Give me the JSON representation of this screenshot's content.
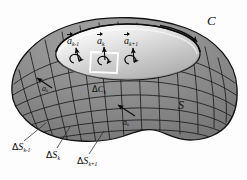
{
  "figure": {
    "kind": "surface-grid-diagram",
    "background_color": "#fdfdfd",
    "surface": {
      "fill_color": "#8b8b8b",
      "cap_fill_color": "#d8d8d8",
      "outline_color": "#141414",
      "grid_color": "#1a1a1a",
      "highlight_color": "#ffffff"
    },
    "labels": {
      "boundary_curve": "C",
      "surface": "S",
      "vector_prev": {
        "symbol": "a",
        "subscript": "k-1"
      },
      "vector_k": {
        "symbol": "a",
        "subscript": "k"
      },
      "vector_next": {
        "symbol": "a",
        "subscript": "k+1"
      },
      "circulation_k": {
        "delta": "Δ",
        "symbol": "C",
        "subscript": "k"
      },
      "normal_left": {
        "symbol": "a",
        "subscript": "k"
      },
      "normal_mid": {
        "symbol": "a",
        "subscript": "k"
      },
      "patch_prev": {
        "delta": "Δ",
        "symbol": "S",
        "subscript": "k-1"
      },
      "patch_k": {
        "delta": "Δ",
        "symbol": "S",
        "subscript": "k"
      },
      "patch_next": {
        "delta": "Δ",
        "symbol": "S",
        "subscript": "k+1"
      }
    },
    "annotations": {
      "cells_with_circulation": 3,
      "highlighted_cell_index": 2,
      "leader_lines": 3,
      "normal_arrows": 5
    }
  }
}
